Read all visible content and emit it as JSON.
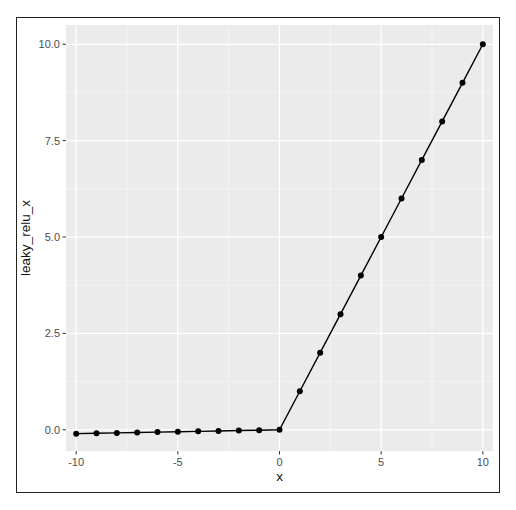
{
  "chart_data": {
    "type": "line",
    "title": "",
    "xlabel": "x",
    "ylabel": "leaky_relu_x",
    "xlim": [
      -10.5,
      10.5
    ],
    "ylim": [
      -0.55,
      10.5
    ],
    "x_ticks": [
      -10,
      -5,
      0,
      5,
      10
    ],
    "x_tick_labels": [
      "-10",
      "-5",
      "0",
      "5",
      "10"
    ],
    "y_ticks": [
      0,
      2.5,
      5,
      7.5,
      10
    ],
    "y_tick_labels": [
      "0.0",
      "2.5",
      "5.0",
      "7.5",
      "10.0"
    ],
    "grid": true,
    "legend": null,
    "markers": true,
    "series": [
      {
        "name": "leaky_relu_x",
        "x": [
          -10,
          -9,
          -8,
          -7,
          -6,
          -5,
          -4,
          -3,
          -2,
          -1,
          0,
          1,
          2,
          3,
          4,
          5,
          6,
          7,
          8,
          9,
          10
        ],
        "y": [
          -0.1,
          -0.09,
          -0.08,
          -0.07,
          -0.06,
          -0.05,
          -0.04,
          -0.03,
          -0.02,
          -0.01,
          0,
          1,
          2,
          3,
          4,
          5,
          6,
          7,
          8,
          9,
          10
        ]
      }
    ],
    "colors": {
      "panel_background": "#ebebeb",
      "grid_major": "#ffffff",
      "line": "#000000",
      "points": "#000000",
      "tick_text": "#4d4d4d",
      "axis_title": "#111111"
    }
  }
}
